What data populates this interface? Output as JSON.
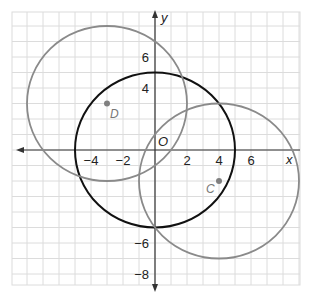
{
  "diagram": {
    "type": "coordinate-plane-circles",
    "grid": {
      "xmin": -9,
      "xmax": 9,
      "ymin": -8.8,
      "ymax": 8.8,
      "step": 1
    },
    "axes": {
      "x_label": "x",
      "y_label": "y",
      "origin_label": "O",
      "x_ticks": [
        {
          "value": -4,
          "label": "−4"
        },
        {
          "value": -2,
          "label": "−2"
        },
        {
          "value": 2,
          "label": "2"
        },
        {
          "value": 4,
          "label": "4"
        },
        {
          "value": 6,
          "label": "6"
        }
      ],
      "y_ticks": [
        {
          "value": 6,
          "label": "6"
        },
        {
          "value": 4,
          "label": "4"
        },
        {
          "value": -6,
          "label": "−6"
        },
        {
          "value": -8,
          "label": "−8"
        }
      ]
    },
    "circles": [
      {
        "name": "circle-O",
        "center": [
          0,
          0
        ],
        "radius": 5,
        "color": "#111111"
      },
      {
        "name": "circle-D",
        "center": [
          -3,
          3
        ],
        "radius": 5,
        "color": "#8a8a8a"
      },
      {
        "name": "circle-C",
        "center": [
          4,
          -2
        ],
        "radius": 5,
        "color": "#8a8a8a"
      }
    ],
    "points": [
      {
        "label": "D",
        "x": -3,
        "y": 3
      },
      {
        "label": "C",
        "x": 4,
        "y": -2
      }
    ],
    "colors": {
      "grid": "#dcdcdc",
      "axis": "#333333",
      "center_circle": "#111111",
      "outer_circles": "#8a8a8a",
      "point": "#808080"
    }
  }
}
